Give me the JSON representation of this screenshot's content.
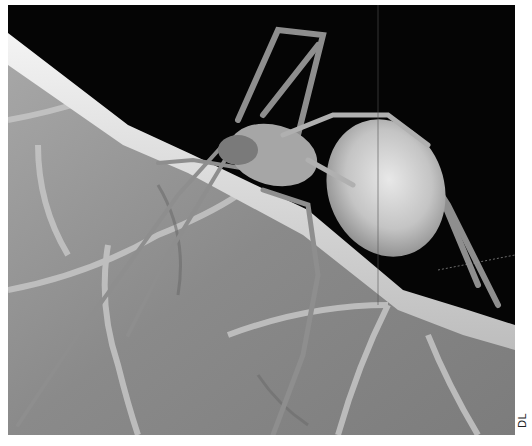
{
  "photo": {
    "subject": "spider on leaf edge",
    "style": "grayscale macro photograph",
    "colors": {
      "background": "#050505",
      "leaf_edge": "#e6e6e6",
      "leaf_blade": "#8e8e8e",
      "abdomen": "#cfcfcf",
      "legs": "#9a9a9a"
    }
  },
  "credit": {
    "text": "DL"
  }
}
